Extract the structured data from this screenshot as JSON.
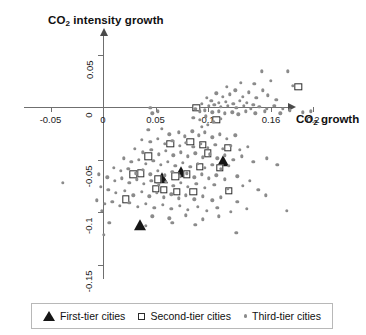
{
  "figure": {
    "y_axis_title_prefix": "CO",
    "y_axis_title_sub": "2",
    "y_axis_title_suffix": " intensity growth",
    "x_axis_title_prefix": "CO",
    "x_axis_title_sub": "2",
    "x_axis_title_suffix": " growth"
  },
  "legend": {
    "items": [
      {
        "marker": "filled-triangle",
        "label": "First-tier cities"
      },
      {
        "marker": "open-square",
        "label": "Second-tier cities"
      },
      {
        "marker": "gray-dot",
        "label": "Third-tier cities"
      }
    ]
  },
  "chart_data": {
    "type": "scatter",
    "title": "",
    "xlabel": "CO2 growth",
    "ylabel": "CO2 intensity growth",
    "xlim": [
      -0.075,
      0.235
    ],
    "ylim": [
      -0.165,
      0.068
    ],
    "grid": false,
    "legend_position": "bottom",
    "xticks": [
      -0.05,
      0,
      0.05,
      0.1,
      0.16,
      0.2
    ],
    "xtick_labels": [
      "-0.05",
      "0",
      "0.05",
      "0.1",
      "0.16",
      "0.2"
    ],
    "yticks": [
      0.05,
      0,
      -0.05,
      -0.1,
      -0.15
    ],
    "ytick_labels": [
      "0.05",
      "0",
      "-0.05",
      "-0.1",
      "-0.15"
    ],
    "series": [
      {
        "name": "First-tier cities",
        "marker": "filled-triangle",
        "color": "#161616",
        "points": [
          [
            0.114,
            -0.052
          ],
          [
            0.074,
            -0.063
          ],
          [
            0.056,
            -0.069
          ],
          [
            0.035,
            -0.113
          ]
        ]
      },
      {
        "name": "Second-tier cities",
        "marker": "open-square",
        "color": "#2b2b2b",
        "points": [
          [
            0.186,
            0.019
          ],
          [
            0.089,
            -0.001
          ],
          [
            0.108,
            -0.012
          ],
          [
            0.095,
            -0.036
          ],
          [
            0.119,
            -0.039
          ],
          [
            0.064,
            -0.035
          ],
          [
            0.083,
            -0.033
          ],
          [
            0.1,
            -0.044
          ],
          [
            0.092,
            -0.057
          ],
          [
            0.08,
            -0.064
          ],
          [
            0.069,
            -0.066
          ],
          [
            0.036,
            -0.063
          ],
          [
            0.029,
            -0.064
          ],
          [
            0.052,
            -0.069
          ],
          [
            0.05,
            -0.078
          ],
          [
            0.058,
            -0.079
          ],
          [
            0.07,
            -0.081
          ],
          [
            0.086,
            -0.081
          ],
          [
            0.12,
            -0.08
          ],
          [
            0.022,
            -0.088
          ],
          [
            0.043,
            -0.047
          ],
          [
            0.111,
            -0.058
          ]
        ]
      },
      {
        "name": "Third-tier cities",
        "marker": "gray-dot",
        "color": "#8b8b8b",
        "points": [
          [
            0.151,
            0.034
          ],
          [
            0.176,
            0.034
          ],
          [
            0.131,
            0.023
          ],
          [
            0.144,
            0.022
          ],
          [
            0.16,
            0.025
          ],
          [
            0.181,
            0.02
          ],
          [
            0.118,
            0.019
          ],
          [
            0.126,
            0.016
          ],
          [
            0.139,
            0.014
          ],
          [
            0.152,
            0.016
          ],
          [
            0.108,
            0.013
          ],
          [
            0.114,
            0.01
          ],
          [
            0.121,
            0.012
          ],
          [
            0.133,
            0.01
          ],
          [
            0.146,
            0.009
          ],
          [
            0.157,
            0.011
          ],
          [
            0.165,
            0.007
          ],
          [
            0.099,
            0.009
          ],
          [
            0.103,
            0.006
          ],
          [
            0.11,
            0.004
          ],
          [
            0.117,
            0.005
          ],
          [
            0.124,
            0.003
          ],
          [
            0.13,
            0.006
          ],
          [
            0.137,
            0.004
          ],
          [
            0.143,
            0.002
          ],
          [
            0.094,
            0.003
          ],
          [
            0.101,
            0.001
          ],
          [
            0.106,
            0.002
          ],
          [
            0.112,
            0.0
          ],
          [
            0.119,
            0.001
          ],
          [
            0.127,
            -0.001
          ],
          [
            0.134,
            0.001
          ],
          [
            0.141,
            -0.002
          ],
          [
            0.149,
            0.0
          ],
          [
            0.156,
            -0.002
          ],
          [
            0.163,
            0.001
          ],
          [
            0.171,
            -0.002
          ],
          [
            0.088,
            -0.002
          ],
          [
            0.092,
            -0.004
          ],
          [
            0.097,
            -0.003
          ],
          [
            0.104,
            -0.005
          ],
          [
            0.11,
            -0.004
          ],
          [
            0.116,
            -0.006
          ],
          [
            0.123,
            -0.005
          ],
          [
            0.129,
            -0.007
          ],
          [
            0.136,
            -0.004
          ],
          [
            0.145,
            -0.006
          ],
          [
            0.154,
            -0.004
          ],
          [
            0.169,
            -0.006
          ],
          [
            0.178,
            -0.003
          ],
          [
            0.19,
            -0.005
          ],
          [
            0.198,
            -0.004
          ],
          [
            0.045,
            -0.001
          ],
          [
            0.047,
            -0.006
          ],
          [
            0.052,
            -0.004
          ],
          [
            0.086,
            -0.01
          ],
          [
            0.092,
            -0.012
          ],
          [
            0.098,
            -0.009
          ],
          [
            0.105,
            -0.014
          ],
          [
            0.112,
            -0.011
          ],
          [
            0.1,
            -0.017
          ],
          [
            0.094,
            -0.019
          ],
          [
            0.043,
            -0.022
          ],
          [
            0.056,
            -0.021
          ],
          [
            0.063,
            -0.026
          ],
          [
            0.072,
            -0.024
          ],
          [
            0.078,
            -0.028
          ],
          [
            0.085,
            -0.023
          ],
          [
            0.091,
            -0.027
          ],
          [
            0.097,
            -0.024
          ],
          [
            0.104,
            -0.029
          ],
          [
            0.111,
            -0.026
          ],
          [
            0.118,
            -0.03
          ],
          [
            0.126,
            -0.027
          ],
          [
            0.037,
            -0.031
          ],
          [
            0.045,
            -0.033
          ],
          [
            0.052,
            -0.03
          ],
          [
            0.059,
            -0.035
          ],
          [
            0.066,
            -0.032
          ],
          [
            0.073,
            -0.037
          ],
          [
            0.079,
            -0.034
          ],
          [
            0.086,
            -0.038
          ],
          [
            0.093,
            -0.035
          ],
          [
            0.1,
            -0.039
          ],
          [
            0.107,
            -0.036
          ],
          [
            0.114,
            -0.04
          ],
          [
            0.122,
            -0.037
          ],
          [
            0.13,
            -0.041
          ],
          [
            0.138,
            -0.038
          ],
          [
            0.03,
            -0.04
          ],
          [
            0.038,
            -0.043
          ],
          [
            0.046,
            -0.041
          ],
          [
            0.053,
            -0.045
          ],
          [
            0.06,
            -0.042
          ],
          [
            0.067,
            -0.046
          ],
          [
            0.074,
            -0.043
          ],
          [
            0.081,
            -0.047
          ],
          [
            0.088,
            -0.044
          ],
          [
            0.095,
            -0.048
          ],
          [
            0.102,
            -0.045
          ],
          [
            0.109,
            -0.049
          ],
          [
            0.116,
            -0.046
          ],
          [
            0.124,
            -0.05
          ],
          [
            0.132,
            -0.047
          ],
          [
            0.02,
            -0.049
          ],
          [
            0.027,
            -0.052
          ],
          [
            0.034,
            -0.05
          ],
          [
            0.041,
            -0.054
          ],
          [
            0.048,
            -0.051
          ],
          [
            0.055,
            -0.055
          ],
          [
            0.062,
            -0.052
          ],
          [
            0.069,
            -0.056
          ],
          [
            0.076,
            -0.053
          ],
          [
            0.083,
            -0.057
          ],
          [
            0.09,
            -0.054
          ],
          [
            0.097,
            -0.058
          ],
          [
            0.104,
            -0.055
          ],
          [
            0.112,
            -0.059
          ],
          [
            0.12,
            -0.056
          ],
          [
            0.143,
            -0.052
          ],
          [
            0.156,
            -0.049
          ],
          [
            0.166,
            -0.055
          ],
          [
            0.01,
            -0.058
          ],
          [
            0.017,
            -0.061
          ],
          [
            0.024,
            -0.059
          ],
          [
            0.031,
            -0.063
          ],
          [
            0.038,
            -0.06
          ],
          [
            0.045,
            -0.064
          ],
          [
            0.052,
            -0.061
          ],
          [
            0.059,
            -0.065
          ],
          [
            0.066,
            -0.062
          ],
          [
            0.073,
            -0.066
          ],
          [
            0.08,
            -0.063
          ],
          [
            0.087,
            -0.067
          ],
          [
            0.094,
            -0.064
          ],
          [
            0.101,
            -0.068
          ],
          [
            0.108,
            -0.065
          ],
          [
            0.116,
            -0.069
          ],
          [
            0.128,
            -0.066
          ],
          [
            0.14,
            -0.07
          ],
          [
            0.004,
            -0.067
          ],
          [
            0.011,
            -0.07
          ],
          [
            0.018,
            -0.068
          ],
          [
            0.025,
            -0.072
          ],
          [
            0.032,
            -0.069
          ],
          [
            0.039,
            -0.073
          ],
          [
            0.046,
            -0.07
          ],
          [
            0.053,
            -0.074
          ],
          [
            0.06,
            -0.071
          ],
          [
            0.067,
            -0.075
          ],
          [
            0.074,
            -0.072
          ],
          [
            0.081,
            -0.076
          ],
          [
            0.089,
            -0.073
          ],
          [
            0.097,
            -0.077
          ],
          [
            0.106,
            -0.074
          ],
          [
            0.119,
            -0.078
          ],
          [
            0.133,
            -0.075
          ],
          [
            0.148,
            -0.079
          ],
          [
            -0.002,
            -0.076
          ],
          [
            0.005,
            -0.079
          ],
          [
            0.012,
            -0.082
          ],
          [
            0.021,
            -0.08
          ],
          [
            0.029,
            -0.084
          ],
          [
            0.037,
            -0.081
          ],
          [
            0.044,
            -0.085
          ],
          [
            0.051,
            -0.082
          ],
          [
            0.058,
            -0.086
          ],
          [
            0.065,
            -0.083
          ],
          [
            0.072,
            -0.087
          ],
          [
            0.079,
            -0.084
          ],
          [
            0.087,
            -0.088
          ],
          [
            0.095,
            -0.085
          ],
          [
            0.104,
            -0.089
          ],
          [
            0.112,
            -0.086
          ],
          [
            0.128,
            -0.09
          ],
          [
            0.155,
            -0.084
          ],
          [
            -0.006,
            -0.089
          ],
          [
            0.002,
            -0.092
          ],
          [
            0.009,
            -0.09
          ],
          [
            0.016,
            -0.094
          ],
          [
            0.025,
            -0.091
          ],
          [
            0.033,
            -0.095
          ],
          [
            0.041,
            -0.092
          ],
          [
            0.049,
            -0.096
          ],
          [
            0.057,
            -0.093
          ],
          [
            0.065,
            -0.097
          ],
          [
            0.073,
            -0.094
          ],
          [
            0.081,
            -0.098
          ],
          [
            0.09,
            -0.095
          ],
          [
            0.099,
            -0.099
          ],
          [
            0.109,
            -0.096
          ],
          [
            0.122,
            -0.1
          ],
          [
            0.137,
            -0.097
          ],
          [
            0.175,
            -0.099
          ],
          [
            0.047,
            -0.104
          ],
          [
            0.063,
            -0.106
          ],
          [
            0.079,
            -0.103
          ],
          [
            0.095,
            -0.107
          ],
          [
            0.11,
            -0.104
          ],
          [
            0.041,
            -0.113
          ],
          [
            0.006,
            -0.11
          ],
          [
            0.001,
            -0.122
          ],
          [
            -0.038,
            -0.072
          ],
          [
            -0.004,
            -0.064
          ],
          [
            -0.001,
            -0.099
          ],
          [
            0.127,
            -0.12
          ],
          [
            0.066,
            -0.11
          ],
          [
            0.088,
            -0.112
          ]
        ]
      }
    ]
  }
}
